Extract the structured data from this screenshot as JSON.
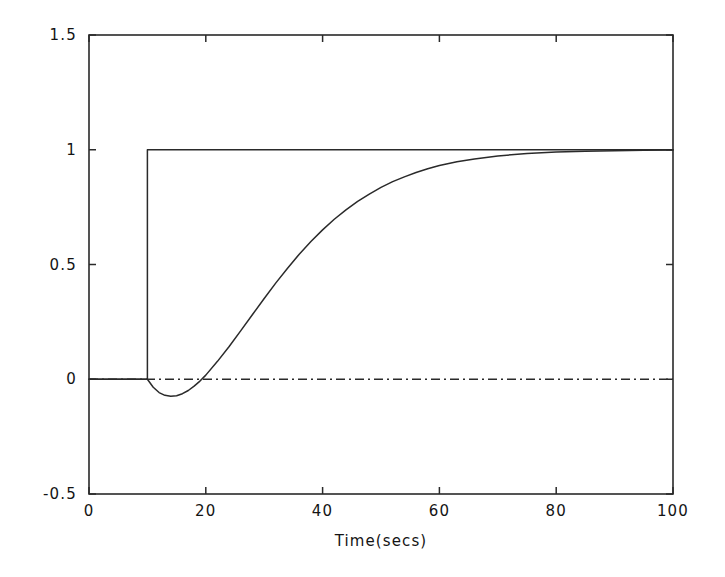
{
  "figure": {
    "background_color": "#ffffff",
    "ink_color": "#2a2a2a"
  },
  "chart_data": {
    "type": "line",
    "title": "",
    "subtitle": "",
    "xlabel": "Time(secs)",
    "ylabel": "",
    "xlim": [
      0,
      100
    ],
    "ylim": [
      -0.5,
      1.5
    ],
    "xticks": [
      0,
      20,
      40,
      60,
      80,
      100
    ],
    "xtick_labels": [
      "0",
      "20",
      "40",
      "60",
      "80",
      "100"
    ],
    "yticks": [
      -0.5,
      0,
      0.5,
      1,
      1.5
    ],
    "ytick_labels": [
      "-0.5",
      "0",
      "0.5",
      "1",
      "1.5"
    ],
    "grid": false,
    "legend": false,
    "legend_position": "none",
    "annotations": [],
    "series": [
      {
        "name": "Step input",
        "style": "solid",
        "description": "Unit step applied at t = 10 s, held at 1 thereafter",
        "x": [
          0,
          10,
          10,
          100
        ],
        "values": [
          0,
          0,
          1,
          1
        ]
      },
      {
        "name": "Output response",
        "style": "solid",
        "description": "Non-minimum-phase (inverse) response: initial undershoot to about -0.07 near t = 15 s, then rise to steady state of 1 by about t = 80 s",
        "x": [
          0,
          2,
          4,
          6,
          8,
          10,
          11,
          12,
          13,
          14,
          15,
          16,
          17,
          18,
          19,
          20,
          22,
          24,
          26,
          28,
          30,
          32,
          34,
          36,
          38,
          40,
          42,
          44,
          46,
          48,
          50,
          52,
          54,
          56,
          58,
          60,
          63,
          66,
          70,
          75,
          80,
          85,
          90,
          95,
          100
        ],
        "values": [
          0,
          0,
          0,
          0,
          0,
          0,
          -0.035,
          -0.058,
          -0.07,
          -0.074,
          -0.072,
          -0.063,
          -0.049,
          -0.03,
          -0.008,
          0.018,
          0.078,
          0.143,
          0.212,
          0.282,
          0.352,
          0.42,
          0.484,
          0.545,
          0.6,
          0.651,
          0.697,
          0.738,
          0.775,
          0.807,
          0.836,
          0.861,
          0.882,
          0.901,
          0.917,
          0.931,
          0.948,
          0.96,
          0.973,
          0.984,
          0.99,
          0.994,
          0.996,
          0.998,
          0.999
        ]
      },
      {
        "name": "Zero reference",
        "style": "dash-dot",
        "description": "Horizontal dash-dot line at y = 0 spanning the full time axis",
        "x": [
          0,
          100
        ],
        "values": [
          0,
          0
        ]
      }
    ]
  },
  "geometry": {
    "plot_left_px": 89,
    "plot_right_px": 673,
    "plot_top_px": 35,
    "plot_bottom_px": 494,
    "tick_length_px": 7
  }
}
